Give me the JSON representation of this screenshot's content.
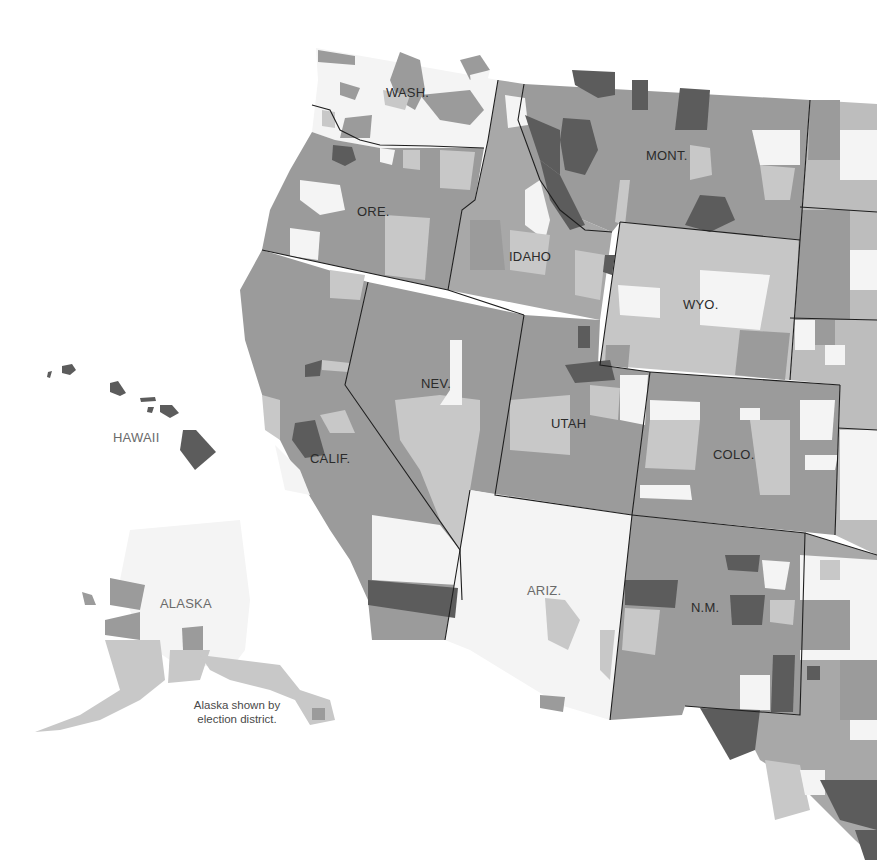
{
  "map": {
    "type": "choropleth",
    "region": "Western United States (by county)",
    "palette": {
      "white": "#f7f7f7",
      "light": "#c8c8c8",
      "medium": "#9b9b9b",
      "dark": "#5c5c5c",
      "border": "#1e1e1e"
    },
    "labels": {
      "wash": "WASH.",
      "ore": "ORE.",
      "idaho": "IDAHO",
      "mont": "MONT.",
      "wyo": "WYO.",
      "nev": "NEV.",
      "utah": "UTAH",
      "colo": "COLO.",
      "calif": "CALIF.",
      "ariz": "ARIZ.",
      "nm": "N.M.",
      "hawaii": "HAWAII",
      "alaska": "ALASKA"
    },
    "note_line1": "Alaska shown by",
    "note_line2": "election district."
  }
}
